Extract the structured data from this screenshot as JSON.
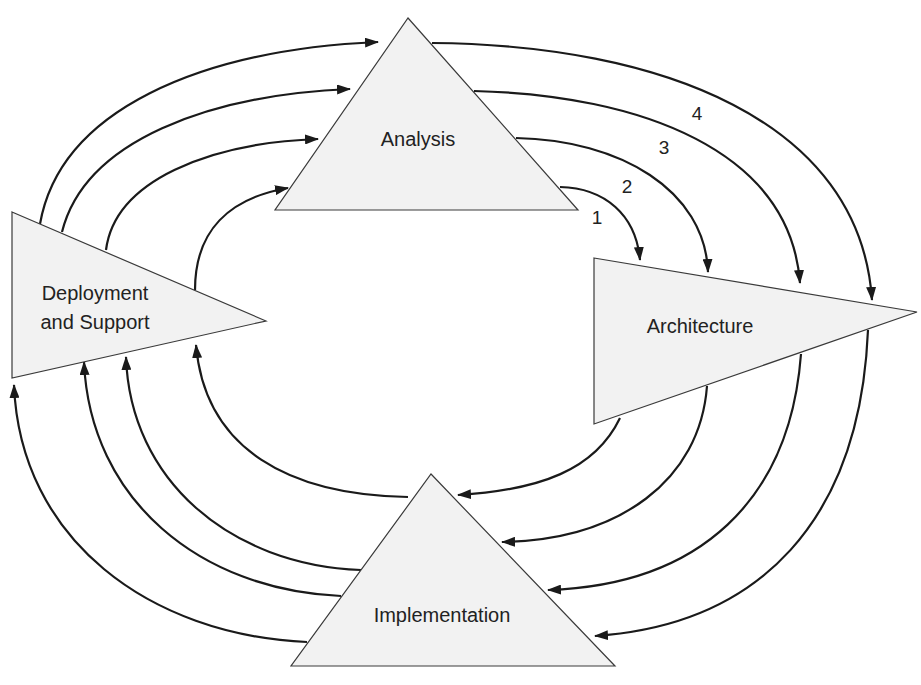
{
  "diagram": {
    "nodes": {
      "analysis": {
        "label": "Analysis"
      },
      "architecture": {
        "label": "Architecture"
      },
      "deployment": {
        "line1": "Deployment",
        "line2": "and Support"
      },
      "implementation": {
        "label": "Implementation"
      }
    },
    "iteration_labels": [
      "1",
      "2",
      "3",
      "4"
    ],
    "colors": {
      "shape_fill": "#f2f2f2",
      "shape_stroke": "#3a3a3a",
      "arrow": "#1a1a1a",
      "background": "#ffffff"
    },
    "flows": [
      {
        "from": "Deployment and Support",
        "to": "Analysis",
        "count": 4
      },
      {
        "from": "Analysis",
        "to": "Architecture",
        "count": 4
      },
      {
        "from": "Architecture",
        "to": "Implementation",
        "count": 4
      },
      {
        "from": "Implementation",
        "to": "Deployment and Support",
        "count": 4
      }
    ]
  }
}
